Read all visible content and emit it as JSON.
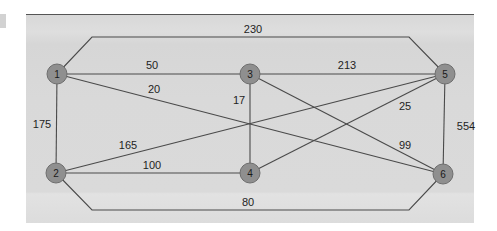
{
  "diagram": {
    "type": "weighted-undirected-graph",
    "colors": {
      "panel_background": "#d9d9d9",
      "edge": "#4a4a4a",
      "node_fill": "#8f8f8f",
      "node_stroke": "#6e6e6e",
      "text": "#1e1e1e"
    },
    "nodes": [
      {
        "id": "1",
        "label": "1",
        "x": 57,
        "y": 74
      },
      {
        "id": "2",
        "label": "2",
        "x": 56,
        "y": 173
      },
      {
        "id": "3",
        "label": "3",
        "x": 250,
        "y": 74
      },
      {
        "id": "4",
        "label": "4",
        "x": 250,
        "y": 173
      },
      {
        "id": "5",
        "label": "5",
        "x": 445,
        "y": 74
      },
      {
        "id": "6",
        "label": "6",
        "x": 443,
        "y": 174
      }
    ],
    "edges": [
      {
        "from": "1",
        "to": "5",
        "weight": "230",
        "path": [
          [
            57,
            74
          ],
          [
            92,
            37
          ],
          [
            409,
            37
          ],
          [
            445,
            74
          ]
        ],
        "label_pos": [
          253,
          29
        ]
      },
      {
        "from": "1",
        "to": "3",
        "weight": "50",
        "path": [
          [
            57,
            74
          ],
          [
            250,
            74
          ]
        ],
        "label_pos": [
          152,
          65
        ]
      },
      {
        "from": "1",
        "to": "6",
        "weight": "20",
        "path": [
          [
            57,
            74
          ],
          [
            443,
            174
          ]
        ],
        "label_pos": [
          154,
          89
        ]
      },
      {
        "from": "1",
        "to": "2",
        "weight": "175",
        "path": [
          [
            57,
            74
          ],
          [
            56,
            173
          ]
        ],
        "label_pos": [
          42,
          124
        ]
      },
      {
        "from": "3",
        "to": "5",
        "weight": "213",
        "path": [
          [
            250,
            74
          ],
          [
            445,
            74
          ]
        ],
        "label_pos": [
          347,
          65
        ]
      },
      {
        "from": "3",
        "to": "4",
        "weight": "17",
        "path": [
          [
            250,
            74
          ],
          [
            250,
            173
          ]
        ],
        "label_pos": [
          239,
          100
        ]
      },
      {
        "from": "3",
        "to": "6",
        "weight": "99",
        "path": [
          [
            250,
            74
          ],
          [
            443,
            174
          ]
        ],
        "label_pos": [
          405,
          145
        ]
      },
      {
        "from": "2",
        "to": "5",
        "weight": "165",
        "path": [
          [
            56,
            173
          ],
          [
            445,
            74
          ]
        ],
        "label_pos": [
          128,
          145
        ]
      },
      {
        "from": "4",
        "to": "5",
        "weight": "25",
        "path": [
          [
            250,
            173
          ],
          [
            445,
            74
          ]
        ],
        "label_pos": [
          405,
          106
        ]
      },
      {
        "from": "2",
        "to": "4",
        "weight": "100",
        "path": [
          [
            56,
            173
          ],
          [
            250,
            173
          ]
        ],
        "label_pos": [
          152,
          165
        ]
      },
      {
        "from": "5",
        "to": "6",
        "weight": "554",
        "path": [
          [
            445,
            74
          ],
          [
            443,
            174
          ]
        ],
        "label_pos": [
          466,
          126
        ]
      },
      {
        "from": "2",
        "to": "6",
        "weight": "80",
        "path": [
          [
            56,
            173
          ],
          [
            92,
            210
          ],
          [
            409,
            210
          ],
          [
            443,
            174
          ]
        ],
        "label_pos": [
          248,
          202
        ]
      }
    ]
  }
}
